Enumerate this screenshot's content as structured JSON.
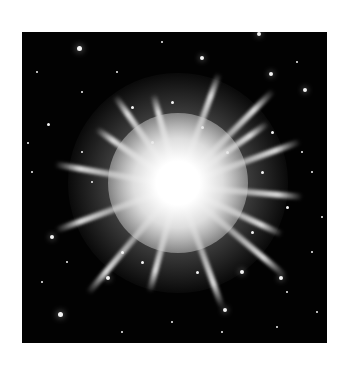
{
  "image": {
    "subject": "bright starburst galaxy cluster on black sky",
    "palette": {
      "background": "#ffffff",
      "sky": "#020202",
      "core": "#ffffff",
      "halo": "#bdbdbd"
    },
    "core_center": {
      "x": 178,
      "y": 183
    }
  },
  "rays": [
    {
      "angle": -70,
      "length": 120
    },
    {
      "angle": -45,
      "length": 135
    },
    {
      "angle": -35,
      "length": 110
    },
    {
      "angle": -20,
      "length": 130
    },
    {
      "angle": 5,
      "length": 125
    },
    {
      "angle": 25,
      "length": 115
    },
    {
      "angle": 40,
      "length": 140
    },
    {
      "angle": 70,
      "length": 130
    },
    {
      "angle": 105,
      "length": 110
    },
    {
      "angle": 130,
      "length": 140
    },
    {
      "angle": 160,
      "length": 130
    },
    {
      "angle": 190,
      "length": 125
    },
    {
      "angle": 215,
      "length": 100
    },
    {
      "angle": 235,
      "length": 110
    },
    {
      "angle": 255,
      "length": 95
    }
  ],
  "stars": [
    [
      57,
      16,
      5
    ],
    [
      237,
      2,
      4
    ],
    [
      26,
      92,
      3
    ],
    [
      6,
      111,
      2
    ],
    [
      283,
      58,
      4
    ],
    [
      249,
      42,
      4
    ],
    [
      38,
      282,
      5
    ],
    [
      180,
      26,
      4
    ],
    [
      10,
      140,
      2
    ],
    [
      300,
      185,
      2
    ],
    [
      290,
      220,
      2
    ],
    [
      30,
      205,
      4
    ],
    [
      220,
      240,
      4
    ],
    [
      259,
      246,
      4
    ],
    [
      86,
      246,
      4
    ],
    [
      203,
      278,
      4
    ],
    [
      150,
      70,
      3
    ],
    [
      110,
      75,
      3
    ],
    [
      250,
      100,
      3
    ],
    [
      265,
      175,
      3
    ],
    [
      70,
      150,
      2
    ],
    [
      100,
      220,
      3
    ],
    [
      60,
      120,
      2
    ],
    [
      240,
      140,
      3
    ],
    [
      180,
      95,
      3
    ],
    [
      130,
      110,
      3
    ],
    [
      205,
      120,
      3
    ],
    [
      120,
      230,
      3
    ],
    [
      175,
      240,
      3
    ],
    [
      230,
      200,
      3
    ],
    [
      60,
      60,
      2
    ],
    [
      280,
      120,
      2
    ],
    [
      20,
      250,
      2
    ],
    [
      295,
      280,
      2
    ],
    [
      150,
      290,
      2
    ],
    [
      100,
      300,
      2
    ],
    [
      200,
      300,
      2
    ],
    [
      255,
      295,
      2
    ],
    [
      15,
      40,
      2
    ],
    [
      95,
      40,
      2
    ],
    [
      140,
      10,
      2
    ],
    [
      275,
      30,
      2
    ],
    [
      45,
      230,
      2
    ],
    [
      265,
      260,
      2
    ],
    [
      290,
      140,
      2
    ]
  ]
}
